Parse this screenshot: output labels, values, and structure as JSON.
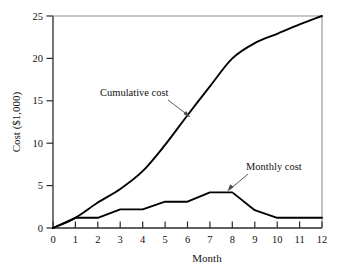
{
  "chart_data": {
    "type": "line",
    "title": "",
    "xlabel": "Month",
    "ylabel": "Cost ($1,000)",
    "xlim": [
      0,
      12
    ],
    "ylim": [
      0,
      25
    ],
    "xticks": [
      0,
      1,
      2,
      3,
      4,
      5,
      6,
      7,
      8,
      9,
      10,
      11,
      12
    ],
    "xticklabels": [
      "0",
      "1",
      "2",
      "3",
      "4",
      "5",
      "6",
      "7",
      "8",
      "9",
      "10",
      "11",
      "12"
    ],
    "yticks": [
      0,
      5,
      10,
      15,
      20,
      25
    ],
    "yticklabels": [
      "0",
      "5",
      "10",
      "15",
      "20",
      "25"
    ],
    "grid": false,
    "legend": "none",
    "line_color": "#000000",
    "background_color": "#ffffff",
    "series": [
      {
        "name": "Cumulative cost",
        "x": [
          0,
          1,
          2,
          3,
          4,
          5,
          6,
          7,
          8,
          9,
          10,
          11,
          12
        ],
        "values": [
          0,
          1.2,
          3.0,
          4.6,
          6.7,
          9.8,
          13.3,
          16.7,
          20.0,
          21.8,
          22.9,
          24.0,
          25.0
        ]
      },
      {
        "name": "Monthly cost",
        "x": [
          0,
          1,
          2,
          3,
          4,
          5,
          6,
          7,
          8,
          9,
          10,
          11,
          12
        ],
        "values": [
          0,
          1.2,
          1.2,
          2.2,
          2.2,
          3.1,
          3.1,
          4.2,
          4.2,
          2.1,
          1.2,
          1.2,
          1.2
        ]
      }
    ],
    "annotations": [
      {
        "text": "Cumulative cost",
        "points_to_series": "Cumulative cost",
        "arrow_direction": "down-right"
      },
      {
        "text": "Monthly cost",
        "points_to_series": "Monthly cost",
        "arrow_direction": "down-left"
      }
    ]
  }
}
